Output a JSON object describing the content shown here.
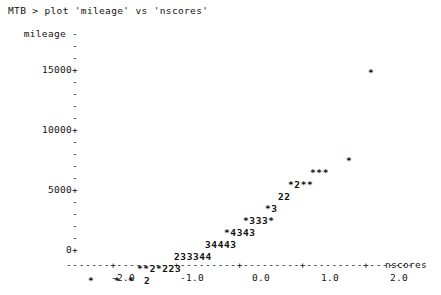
{
  "terminal": {
    "prompt_line": "MTB > plot 'mileage' vs 'nscores'"
  },
  "chart_data": {
    "type": "scatter",
    "title": "",
    "render_style": "character-cell-text-plot",
    "software": "Minitab",
    "xlabel": "nscores",
    "ylabel": "mileage",
    "xlim": [
      -2.75,
      2.75
    ],
    "ylim": [
      0,
      17000
    ],
    "grid": false,
    "legend": null,
    "y_ticks_labeled": [
      "0+",
      "5000+",
      "10000+",
      "15000+"
    ],
    "y_tick_values": [
      0,
      5000,
      10000,
      15000
    ],
    "y_minor_tick_glyph": "-",
    "y_major_tick_glyph": "+",
    "x_tick_labels": [
      "-2.0",
      "-1.0",
      "0.0",
      "1.0",
      "2.0"
    ],
    "x_tick_values": [
      -2.0,
      -1.0,
      0.0,
      1.0,
      2.0
    ],
    "x_axis_glyph": "+",
    "x_axis_fill_glyph": "-",
    "point_glyph": "*",
    "count_glyph_note": "digits denote number of coincident observations",
    "rows": [
      {
        "text": "*",
        "x_px": 368,
        "y_px": 39,
        "y_value": 15000
      },
      {
        "text": "*",
        "x_px": 346,
        "y_px": 127,
        "y_value": 9700
      },
      {
        "text": "***",
        "x_px": 310,
        "y_px": 139,
        "y_value": 9000
      },
      {
        "text": "*2**",
        "x_px": 288,
        "y_px": 151,
        "y_value": 8400
      },
      {
        "text": "22",
        "x_px": 278,
        "y_px": 163,
        "y_value": 7700
      },
      {
        "text": "*3",
        "x_px": 265,
        "y_px": 175,
        "y_value": 7100
      },
      {
        "text": "*333*",
        "x_px": 243,
        "y_px": 187,
        "y_value": 6400
      },
      {
        "text": "*4343",
        "x_px": 224,
        "y_px": 199,
        "y_value": 5800
      },
      {
        "text": "34443",
        "x_px": 205,
        "y_px": 211,
        "y_value": 5100
      },
      {
        "text": "233344",
        "x_px": 174,
        "y_px": 223,
        "y_value": 4400
      },
      {
        "text": "**2*223",
        "x_px": 137,
        "y_px": 235,
        "y_value": 3800
      },
      {
        "text": "*",
        "x_px": 88,
        "y_px": 247,
        "y_value": 0
      },
      {
        "text": "*",
        "x_px": 114,
        "y_px": 247,
        "y_value": 0
      },
      {
        "text": "*",
        "x_px": 128,
        "y_px": 247,
        "y_value": 0
      },
      {
        "text": "2",
        "x_px": 144,
        "y_px": 247,
        "y_value": 0
      }
    ],
    "y_axis_rows": [
      {
        "label": "mileage -",
        "y_px": 0,
        "major": false
      },
      {
        "label": "-",
        "y_px": 12,
        "major": false
      },
      {
        "label": "-",
        "y_px": 24,
        "major": false
      },
      {
        "label": "15000+",
        "y_px": 36,
        "major": true
      },
      {
        "label": "-",
        "y_px": 48,
        "major": false
      },
      {
        "label": "-",
        "y_px": 60,
        "major": false
      },
      {
        "label": "-",
        "y_px": 72,
        "major": false
      },
      {
        "label": "-",
        "y_px": 84,
        "major": false
      },
      {
        "label": "10000+",
        "y_px": 96,
        "major": true
      },
      {
        "label": "-",
        "y_px": 108,
        "major": false
      },
      {
        "label": "-",
        "y_px": 120,
        "major": false
      },
      {
        "label": "-",
        "y_px": 132,
        "major": false
      },
      {
        "label": "-",
        "y_px": 144,
        "major": false
      },
      {
        "label": "5000+",
        "y_px": 156,
        "major": true
      },
      {
        "label": "-",
        "y_px": 168,
        "major": false
      },
      {
        "label": "-",
        "y_px": 180,
        "major": false
      },
      {
        "label": "-",
        "y_px": 192,
        "major": false
      },
      {
        "label": "-",
        "y_px": 204,
        "major": false
      },
      {
        "label": "0+",
        "y_px": 216,
        "major": true
      }
    ],
    "x_tick_positions_px": [
      123,
      192,
      261,
      330,
      399
    ],
    "x_axis_text": "-------+---------+---------+---------+---------+-------",
    "colors": {
      "background": "#ffffff",
      "foreground": "#111111"
    }
  }
}
